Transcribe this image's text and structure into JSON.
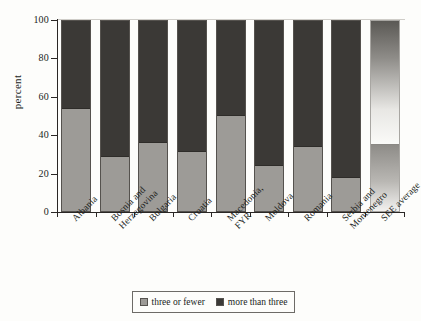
{
  "chart_data": {
    "type": "bar",
    "stacked": true,
    "title": "",
    "xlabel": "",
    "ylabel": "percent",
    "ylim": [
      0,
      100
    ],
    "yticks": [
      0,
      20,
      40,
      60,
      80,
      100
    ],
    "grid": false,
    "legend_position": "bottom",
    "categories": [
      "Albania",
      "Bosnia and\nHerzegovina",
      "Bulgaria",
      "Croatia",
      "Macedonia,\nFYR",
      "Moldova",
      "Romania",
      "Serbia and\nMontenegro",
      "SEE average"
    ],
    "series": [
      {
        "name": "three or fewer",
        "color": "#9d9b97",
        "values": [
          54,
          29,
          36.5,
          31.5,
          50.5,
          24,
          34,
          18,
          35.5
        ]
      },
      {
        "name": "more than three",
        "color": "#3b3936",
        "values": [
          46,
          71,
          63.5,
          68.5,
          49.5,
          76,
          66,
          82,
          64.5
        ]
      }
    ]
  },
  "legend": {
    "items": [
      {
        "label": "three or fewer"
      },
      {
        "label": "more than three"
      }
    ]
  }
}
